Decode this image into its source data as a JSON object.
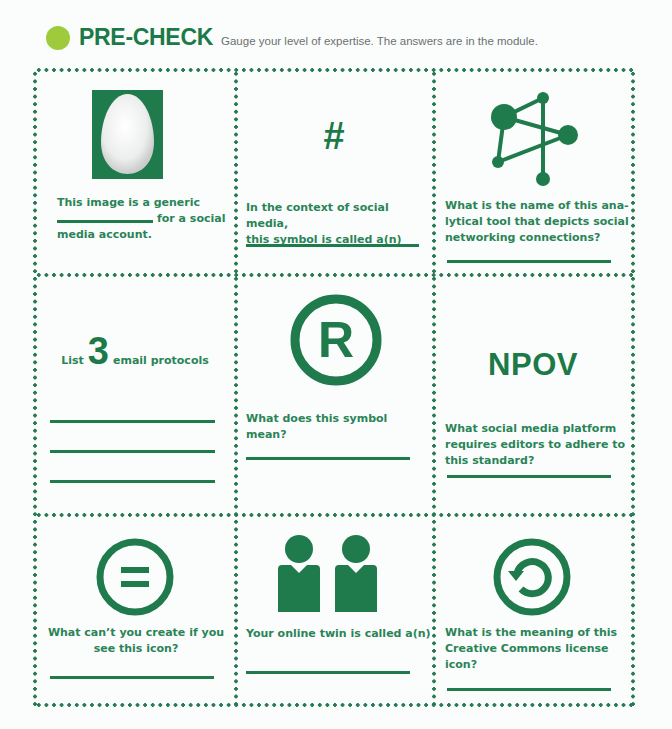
{
  "header": {
    "title": "PRE-CHECK",
    "subtitle": "Gauge your level of expertise. The answers are in the module."
  },
  "colors": {
    "primary_green": "#1f7a4c",
    "bullet_lime": "#9ecb3c",
    "subtitle_gray": "#6b7072"
  },
  "cells": [
    {
      "icon": "egg-avatar-icon",
      "question_line1": "This image is a generic",
      "question_line2_suffix": "for a social",
      "question_line3": "media account."
    },
    {
      "icon": "hashtag-icon",
      "symbol": "#",
      "question_line1": "In the context of social media,",
      "question_line2": "this symbol is called a(n)"
    },
    {
      "icon": "network-graph-icon",
      "question_line1": "What is the name of this ana-",
      "question_line2": "lytical tool that depicts social",
      "question_line3": "networking connections?"
    },
    {
      "prefix": "List",
      "number": "3",
      "suffix": "email protocols",
      "answer_lines": 3
    },
    {
      "icon": "registered-trademark-icon",
      "symbol": "R",
      "question_line1": "What does this symbol mean?"
    },
    {
      "symbol": "NPOV",
      "question_line1": "What social media platform",
      "question_line2": "requires editors to adhere to",
      "question_line3": "this standard?"
    },
    {
      "icon": "no-derivatives-icon",
      "question_line1": "What can’t you create if you",
      "question_line2": "see this icon?"
    },
    {
      "icon": "twin-persons-icon",
      "question_line1": "Your online twin is called a(n)"
    },
    {
      "icon": "share-alike-icon",
      "question_line1": "What is the meaning of this",
      "question_line2": "Creative Commons license",
      "question_line3": "icon?"
    }
  ]
}
